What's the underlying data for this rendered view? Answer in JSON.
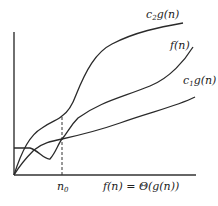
{
  "title": "f(n) = Θ(g(n))",
  "labels": {
    "upper": "c",
    "upper_sub": "2",
    "upper_rest": "g(n)",
    "middle": "f(n)",
    "lower": "c",
    "lower_sub": "1",
    "lower_rest": "g(n)",
    "x_marker": "n",
    "x_marker_sub": "0",
    "caption": "f(n) = Θ(g(n))"
  },
  "colors": {
    "line": "#2a2a2a",
    "axis": "#333333"
  }
}
